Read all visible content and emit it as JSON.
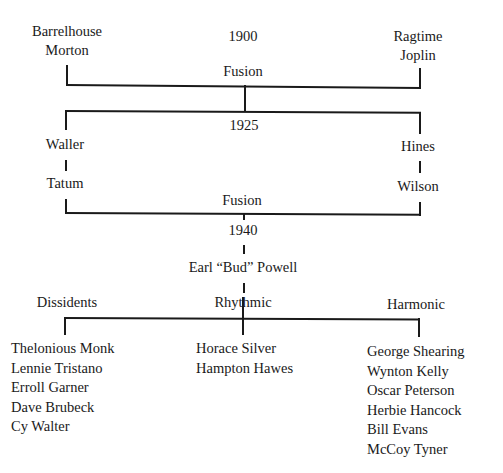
{
  "diagram": {
    "type": "genealogy-tree",
    "level1": {
      "year": "1900",
      "left": {
        "line1": "Barrelhouse",
        "line2": "Morton"
      },
      "right": {
        "line1": "Ragtime",
        "line2": "Joplin"
      },
      "merge_label": "Fusion"
    },
    "level2": {
      "year": "1925",
      "left": [
        "Waller",
        "Tatum"
      ],
      "right": [
        "Hines",
        "Wilson"
      ],
      "merge_label": "Fusion"
    },
    "level3": {
      "year": "1940",
      "central_figure": "Earl “Bud” Powell"
    },
    "branches": [
      {
        "name": "Dissidents",
        "members": [
          "Thelonious Monk",
          "Lennie Tristano",
          "Erroll Garner",
          "Dave Brubeck",
          "Cy Walter"
        ]
      },
      {
        "name": "Rhythmic",
        "members": [
          "Horace Silver",
          "Hampton Hawes"
        ]
      },
      {
        "name": "Harmonic",
        "members": [
          "George Shearing",
          "Wynton Kelly",
          "Oscar Peterson",
          "Herbie Hancock",
          "Bill Evans",
          "McCoy Tyner"
        ]
      }
    ]
  }
}
